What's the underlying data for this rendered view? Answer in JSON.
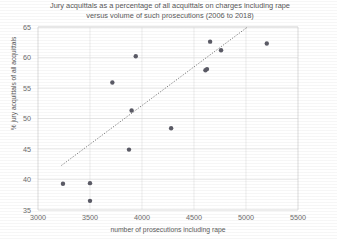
{
  "chart_data": {
    "type": "scatter",
    "title": "Jury acquittals as a percentage of all acquittals on charges including rape versus volume of such prosecutions (2006 to 2018)",
    "title_lines": [
      "Jury acquittals as a percentage of all acquittals on charges including rape",
      "versus volume of such prosecutions  (2006 to 2018)"
    ],
    "xlabel": "number of prosecutions including rape",
    "ylabel": "% jury acquittals of all acquittals",
    "xlim": [
      3000,
      5500
    ],
    "ylim": [
      35,
      65
    ],
    "xticks": [
      3000,
      3500,
      4000,
      4500,
      5000,
      5500
    ],
    "yticks": [
      35,
      40,
      45,
      50,
      55,
      60,
      65
    ],
    "grid": true,
    "legend": "none",
    "series": [
      {
        "name": "jury acquittals vs prosecutions",
        "marker": "circle",
        "color": "#5b5b66",
        "points": [
          {
            "x": 3240,
            "y": 39.3
          },
          {
            "x": 3500,
            "y": 39.4
          },
          {
            "x": 3500,
            "y": 36.5
          },
          {
            "x": 3715,
            "y": 55.9
          },
          {
            "x": 3875,
            "y": 44.9
          },
          {
            "x": 3900,
            "y": 51.3
          },
          {
            "x": 3940,
            "y": 60.2
          },
          {
            "x": 4280,
            "y": 48.4
          },
          {
            "x": 4610,
            "y": 57.9
          },
          {
            "x": 4625,
            "y": 58.1
          },
          {
            "x": 4655,
            "y": 62.6
          },
          {
            "x": 4760,
            "y": 61.2
          },
          {
            "x": 5200,
            "y": 62.3
          }
        ]
      }
    ],
    "trendline": {
      "style": "dotted",
      "color": "#6a6a6a",
      "x_start": 3225,
      "y_start": 42.3,
      "x_end": 5015,
      "y_end": 65.0
    }
  },
  "axis_colors": {
    "grid": "#e4e4e4",
    "axis": "#d2d2d2",
    "text": "#5a5a5a",
    "marker": "#5b5b66"
  }
}
